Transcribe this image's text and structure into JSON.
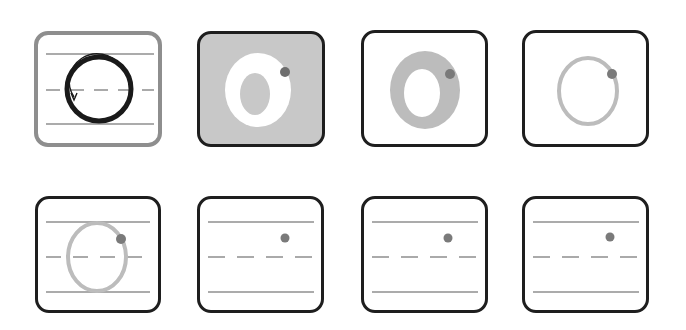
{
  "colors": {
    "frame_dark": "#1e1e1e",
    "frame_highlight": "#8e8e8e",
    "guide_line": "#8f8f8f",
    "fill_gray": "#c8c8c8",
    "stroke_gray": "#bcbcbc",
    "ink": "#1a1a1a",
    "start_dot": "#7a7a7a",
    "white": "#ffffff"
  },
  "cards": [
    {
      "id": 1,
      "label": "step-1-trace-direction",
      "x": 34,
      "y": 31,
      "w": 128,
      "h": 116,
      "style": "highlighted",
      "content": "guide lines + bold circle with counter-clockwise arrow"
    },
    {
      "id": 2,
      "label": "step-2-filled-shape",
      "x": 197,
      "y": 31,
      "w": 128,
      "h": 116,
      "style": "gray-background",
      "content": "white thick O on gray with start dot"
    },
    {
      "id": 3,
      "label": "step-3-gray-thick-o",
      "x": 361,
      "y": 30,
      "w": 127,
      "h": 117,
      "style": "plain",
      "content": "gray thick O with start dot"
    },
    {
      "id": 4,
      "label": "step-4-thin-outline",
      "x": 522,
      "y": 30,
      "w": 127,
      "h": 117,
      "style": "plain",
      "content": "thin gray O outline with start dot"
    },
    {
      "id": 5,
      "label": "step-5-on-lines",
      "x": 35,
      "y": 196,
      "w": 126,
      "h": 117,
      "style": "plain",
      "content": "guide lines + thin gray O with start dot"
    },
    {
      "id": 6,
      "label": "step-6-blank-lines",
      "x": 197,
      "y": 196,
      "w": 127,
      "h": 117,
      "style": "plain",
      "content": "guide lines with start dot only"
    },
    {
      "id": 7,
      "label": "step-7-blank-lines",
      "x": 361,
      "y": 196,
      "w": 127,
      "h": 117,
      "style": "plain",
      "content": "guide lines with start dot only"
    },
    {
      "id": 8,
      "label": "step-8-blank-lines",
      "x": 522,
      "y": 196,
      "w": 127,
      "h": 117,
      "style": "plain",
      "content": "guide lines with start dot only"
    }
  ]
}
